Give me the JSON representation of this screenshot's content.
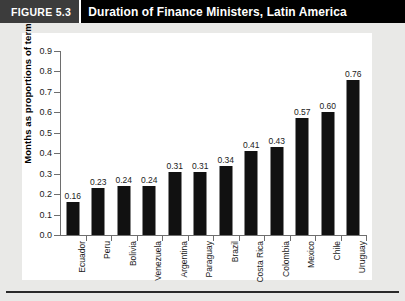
{
  "header": {
    "figure_number": "FIGURE 5.3",
    "title": "Duration of Finance Ministers, Latin America"
  },
  "colors": {
    "header_band": "#000000",
    "figure_number_block": "#3c3c3c",
    "bar": "#111111",
    "page_background": "#e9e9e7",
    "plot_background": "#ffffff",
    "axis_line": "#6e6e6e"
  },
  "chart_data": {
    "type": "bar",
    "title": "Duration of Finance Ministers, Latin America",
    "xlabel": "",
    "ylabel": "Months as proportions of term",
    "categories": [
      "Ecuador",
      "Peru",
      "Bolivia",
      "Venezuela",
      "Argentina",
      "Paraguay",
      "Brazil",
      "Costa Rica",
      "Colombia",
      "Mexico",
      "Chile",
      "Uruguay"
    ],
    "values": [
      0.16,
      0.23,
      0.24,
      0.24,
      0.31,
      0.31,
      0.34,
      0.41,
      0.43,
      0.57,
      0.6,
      0.76
    ],
    "value_labels": [
      "0.16",
      "0.23",
      "0.24",
      "0.24",
      "0.31",
      "0.31",
      "0.34",
      "0.41",
      "0.43",
      "0.57",
      "0.60",
      "0.76"
    ],
    "ylim": [
      0.0,
      0.9
    ],
    "ytick_values": [
      0.0,
      0.1,
      0.2,
      0.3,
      0.4,
      0.5,
      0.6,
      0.7,
      0.8,
      0.9
    ],
    "ytick_labels": [
      "0.0",
      "0.1",
      "0.2",
      "0.3",
      "0.4",
      "0.5",
      "0.6",
      "0.7",
      "0.8",
      "0.9"
    ],
    "grid": false,
    "legend": false,
    "legend_position": "none",
    "orientation": "vertical",
    "value_labels_shown": true,
    "xtick_label_rotation": -90
  }
}
